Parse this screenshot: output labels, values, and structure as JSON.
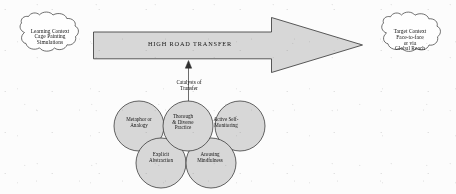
{
  "diagram": {
    "title_text": "HIGH ROAD TRANSFER",
    "source_cloud": {
      "name": "learning-context-cloud",
      "lines": [
        "Learning Context",
        "Cage Painting",
        "Simulations"
      ]
    },
    "target_cloud": {
      "name": "target-context-cloud",
      "lines": [
        "Target Context",
        "Face-to-face",
        "or via",
        "Global Reach"
      ]
    },
    "arrow": {
      "name": "high-road-transfer-arrow",
      "label": "HIGH ROAD TRANSFER",
      "direction": "left-to-right",
      "fill": "#d8d8d8",
      "stroke": "#3a3a3a"
    },
    "catalysts_label": {
      "lines": [
        "Catalysts of",
        "Transfer"
      ]
    },
    "catalyst_circles": [
      {
        "name": "metaphor-or-analogy-circle",
        "lines": [
          "Metaphor or",
          "Analogy"
        ]
      },
      {
        "name": "thorough-diverse-practice-circle",
        "lines": [
          "Thorough",
          "& Diverse",
          "Practice"
        ]
      },
      {
        "name": "active-self-monitoring-circle",
        "lines": [
          "Active Self-",
          "Monitoring"
        ]
      },
      {
        "name": "explicit-abstraction-circle",
        "lines": [
          "Explicit",
          "Abstraction"
        ]
      },
      {
        "name": "arousing-mindfulness-circle",
        "lines": [
          "Arousing",
          "Mindfulness"
        ]
      }
    ],
    "colors": {
      "background": "#fdfdfd",
      "shape_fill": "#d8d8d8",
      "cloud_fill": "#ffffff",
      "stroke": "#3a3a3a",
      "text": "#101010"
    }
  }
}
